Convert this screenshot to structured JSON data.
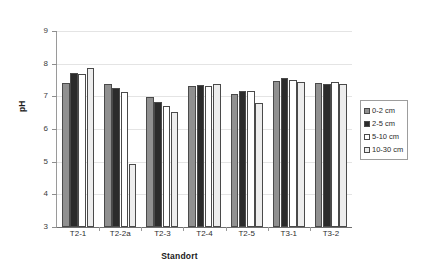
{
  "chart_data": {
    "type": "bar",
    "title": "",
    "xlabel": "Standort",
    "ylabel": "pH",
    "ylim": [
      3,
      9
    ],
    "ytick_labels": [
      "9",
      "8",
      "7",
      "6",
      "5",
      "4",
      "3"
    ],
    "yticks": [
      9,
      8,
      7,
      6,
      5,
      4,
      3
    ],
    "grid": true,
    "legend_position": "right",
    "categories": [
      "T2-1",
      "T2-2a",
      "T2-3",
      "T2-4",
      "T2-5",
      "T3-1",
      "T3-2"
    ],
    "series": [
      {
        "name": "0-2 cm",
        "color": "#909090",
        "values": [
          7.42,
          7.37,
          6.98,
          7.32,
          7.06,
          7.46,
          7.4
        ]
      },
      {
        "name": "2-5 cm",
        "color": "#2b2b2b",
        "values": [
          7.71,
          7.26,
          6.83,
          7.36,
          7.15,
          7.56,
          7.39
        ]
      },
      {
        "name": "5-10 cm",
        "color": "#ffffff",
        "values": [
          7.67,
          7.12,
          6.71,
          7.33,
          7.17,
          7.5,
          7.45
        ]
      },
      {
        "name": "10-30 cm",
        "color": "#ededed",
        "values": [
          7.87,
          4.93,
          6.51,
          7.37,
          6.81,
          7.44,
          7.39
        ]
      }
    ]
  },
  "legend": {
    "items": [
      {
        "label": "0-2 cm"
      },
      {
        "label": "2-5 cm"
      },
      {
        "label": "5-10 cm"
      },
      {
        "label": "10-30 cm"
      }
    ]
  }
}
